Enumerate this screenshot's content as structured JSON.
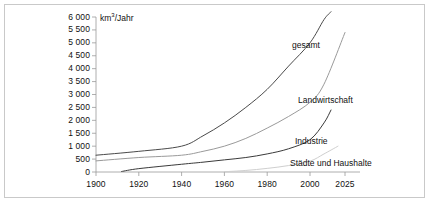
{
  "figure": {
    "unit_label": "km3/Jahr",
    "unit_prefix": "km",
    "unit_exponent": "3",
    "unit_suffix": "/Jahr",
    "border_color": "#c9c9c9",
    "background_color": "#ffffff"
  },
  "chart_data": {
    "type": "line",
    "title": "",
    "xlabel": "",
    "ylabel": "km3/Jahr",
    "xlim": [
      1900,
      2030
    ],
    "ylim": [
      0,
      6000
    ],
    "grid": false,
    "legend_position": "inline-right",
    "xticks": [
      1900,
      1920,
      1940,
      1960,
      1980,
      2000,
      2025
    ],
    "xtick_labels": [
      "1900",
      "1920",
      "1940",
      "1960",
      "1980",
      "2000",
      "2025"
    ],
    "yticks": [
      0,
      500,
      1000,
      1500,
      2000,
      2500,
      3000,
      3500,
      4000,
      4500,
      5000,
      5500,
      6000
    ],
    "ytick_labels": [
      "0",
      "500",
      "1 000",
      "1 500",
      "2 000",
      "2 500",
      "3 000",
      "3 500",
      "4 000",
      "4 500",
      "5 000",
      "5 500",
      "6 000"
    ],
    "series": [
      {
        "name": "gesamt",
        "label": "gesamt",
        "color": "#4a4a4a",
        "x": [
          1900,
          1920,
          1940,
          1950,
          1960,
          1970,
          1980,
          1990,
          2000,
          2010,
          2015
        ],
        "values": [
          650,
          800,
          1000,
          1400,
          1900,
          2500,
          3200,
          4100,
          5000,
          5900,
          6200
        ]
      },
      {
        "name": "landwirtschaft",
        "label": "Landwirtschaft",
        "color": "#9a9a9a",
        "x": [
          1900,
          1920,
          1940,
          1950,
          1960,
          1970,
          1980,
          1990,
          2000,
          2010,
          2025
        ],
        "values": [
          430,
          560,
          650,
          800,
          1000,
          1300,
          1700,
          2150,
          2700,
          3400,
          5400
        ]
      },
      {
        "name": "industrie",
        "label": "Industrie",
        "color": "#3a3a3a",
        "x": [
          1912,
          1920,
          1940,
          1950,
          1960,
          1970,
          1980,
          1990,
          2000,
          2010,
          2015
        ],
        "values": [
          20,
          130,
          300,
          380,
          470,
          560,
          700,
          900,
          1250,
          1900,
          2400
        ]
      },
      {
        "name": "staedte-und-haushalte",
        "label": "Städte und Haushalte",
        "color": "#cfcfcf",
        "x": [
          1960,
          1970,
          1980,
          1990,
          2000,
          2010,
          2020
        ],
        "values": [
          10,
          60,
          140,
          250,
          420,
          700,
          1000
        ]
      }
    ]
  }
}
